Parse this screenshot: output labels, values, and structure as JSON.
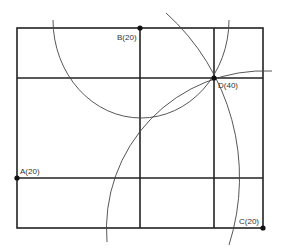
{
  "diagram": {
    "colors": {
      "line": "#222222",
      "arc": "#444444",
      "point": "#111111",
      "background": "#ffffff"
    },
    "grid": {
      "outer": {
        "x": 17,
        "y": 28,
        "width": 246,
        "height": 200
      },
      "verticals": [
        140,
        214
      ],
      "horizontals": [
        78,
        178
      ]
    },
    "points": [
      {
        "id": "B",
        "label": "B(20)",
        "x": 140,
        "y": 28
      },
      {
        "id": "D",
        "label": "D(40)",
        "x": 214,
        "y": 78
      },
      {
        "id": "A",
        "label": "A(20)",
        "x": 17,
        "y": 178
      },
      {
        "id": "C",
        "label": "C(20)",
        "x": 263,
        "y": 228
      }
    ],
    "arcs": [
      {
        "name": "arc-centered-b",
        "center": "B",
        "radius": 74
      },
      {
        "name": "arc-centered-a",
        "center": "A",
        "radius": 221
      },
      {
        "name": "arc-centered-c",
        "center": "C",
        "radius": 158
      }
    ]
  }
}
